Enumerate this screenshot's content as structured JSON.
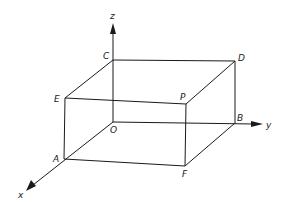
{
  "diagram": {
    "type": "3d-rectangular-box",
    "axes": {
      "x": {
        "label": "x"
      },
      "y": {
        "label": "y"
      },
      "z": {
        "label": "z"
      }
    },
    "vertices": {
      "O": {
        "label": "O"
      },
      "A": {
        "label": "A"
      },
      "B": {
        "label": "B"
      },
      "C": {
        "label": "C"
      },
      "D": {
        "label": "D"
      },
      "E": {
        "label": "E"
      },
      "F": {
        "label": "F"
      },
      "P": {
        "label": "P"
      }
    },
    "edges": [
      "O-A",
      "O-B",
      "O-C",
      "A-E",
      "A-F",
      "B-F",
      "B-D",
      "C-D",
      "C-E",
      "E-P",
      "P-F",
      "P-D"
    ],
    "colors": {
      "ink": "#1a1a1a",
      "background": "#ffffff"
    }
  }
}
